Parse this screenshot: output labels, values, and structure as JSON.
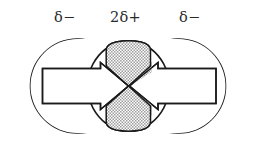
{
  "figure": {
    "background_color": "#ffffff",
    "outline_color": "#1a1a1a",
    "fill_white": "#ffffff",
    "stipple_color": "#b8b8b8",
    "label_color": "#2b2b2b"
  },
  "labels": {
    "left": "δ−",
    "center": "2δ+",
    "right": "δ−"
  },
  "shapes": {
    "left_atom": {
      "name": "left-circle",
      "charge": "δ−",
      "cx": 77.5,
      "cy": 86,
      "r": 47,
      "fill": "#ffffff"
    },
    "right_atom": {
      "name": "right-circle",
      "charge": "δ−",
      "cx": 178.5,
      "cy": 86,
      "r": 47,
      "fill": "#ffffff"
    },
    "center_region": {
      "name": "central-hourglass",
      "charge": "2δ+",
      "fill": "stipple",
      "x_left": 106,
      "x_right": 150,
      "y_top": 42,
      "y_bottom": 130,
      "waist_y": 86
    },
    "left_arrow": {
      "name": "left-bond-arrow",
      "x": 42,
      "y": 68,
      "width": 58,
      "height": 38,
      "direction": "right"
    },
    "right_arrow": {
      "name": "right-bond-arrow",
      "x": 156,
      "y": 68,
      "width": 60,
      "height": 38,
      "direction": "left"
    }
  }
}
